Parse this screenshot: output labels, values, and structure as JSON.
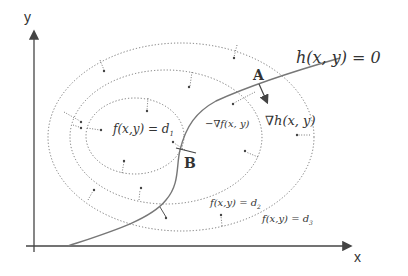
{
  "diagram": {
    "axes": {
      "x_label": "x",
      "y_label": "y"
    },
    "constraint_label": "h(x, y) = 0",
    "points": {
      "A": "A",
      "B": "B"
    },
    "gradients": {
      "neg_grad_f": "−∇f(x, y)",
      "grad_h": "∇h(x, y)"
    },
    "contours": [
      {
        "label": "f(x,y) = d",
        "subscript": "1"
      },
      {
        "label": "f(x,y) = d",
        "subscript": "2"
      },
      {
        "label": "f(x,y) = d",
        "subscript": "3"
      }
    ],
    "colors": {
      "line": "#777777",
      "text": "#333333",
      "background": "#ffffff"
    }
  }
}
